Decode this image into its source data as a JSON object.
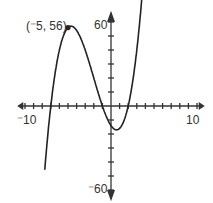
{
  "chart_data": {
    "type": "line",
    "title": "",
    "xlabel": "",
    "ylabel": "",
    "xlim": [
      -10,
      10
    ],
    "ylim": [
      -60,
      60
    ],
    "x_tick_step": 1,
    "y_tick_step": 10,
    "tick_labels": {
      "x_min": "⁻10",
      "x_max": "10",
      "y_max": "60",
      "y_min": "⁻60"
    },
    "grid": false,
    "legend": null,
    "function": "y = (x+7)(x+1)(x-2)",
    "series": [
      {
        "name": "cubic",
        "x": [
          -7.7,
          -7,
          -6,
          -5,
          -4,
          -3,
          -2,
          -1,
          0,
          0.65,
          1,
          2,
          3,
          3.6
        ],
        "y": [
          -63,
          0,
          40,
          56,
          54,
          40,
          20,
          0,
          -14,
          -17,
          -16,
          0,
          40,
          76
        ]
      }
    ],
    "annotations": [
      {
        "text": "(⁻5, 56)",
        "x": -5,
        "y": 56,
        "marker": "point"
      }
    ]
  }
}
